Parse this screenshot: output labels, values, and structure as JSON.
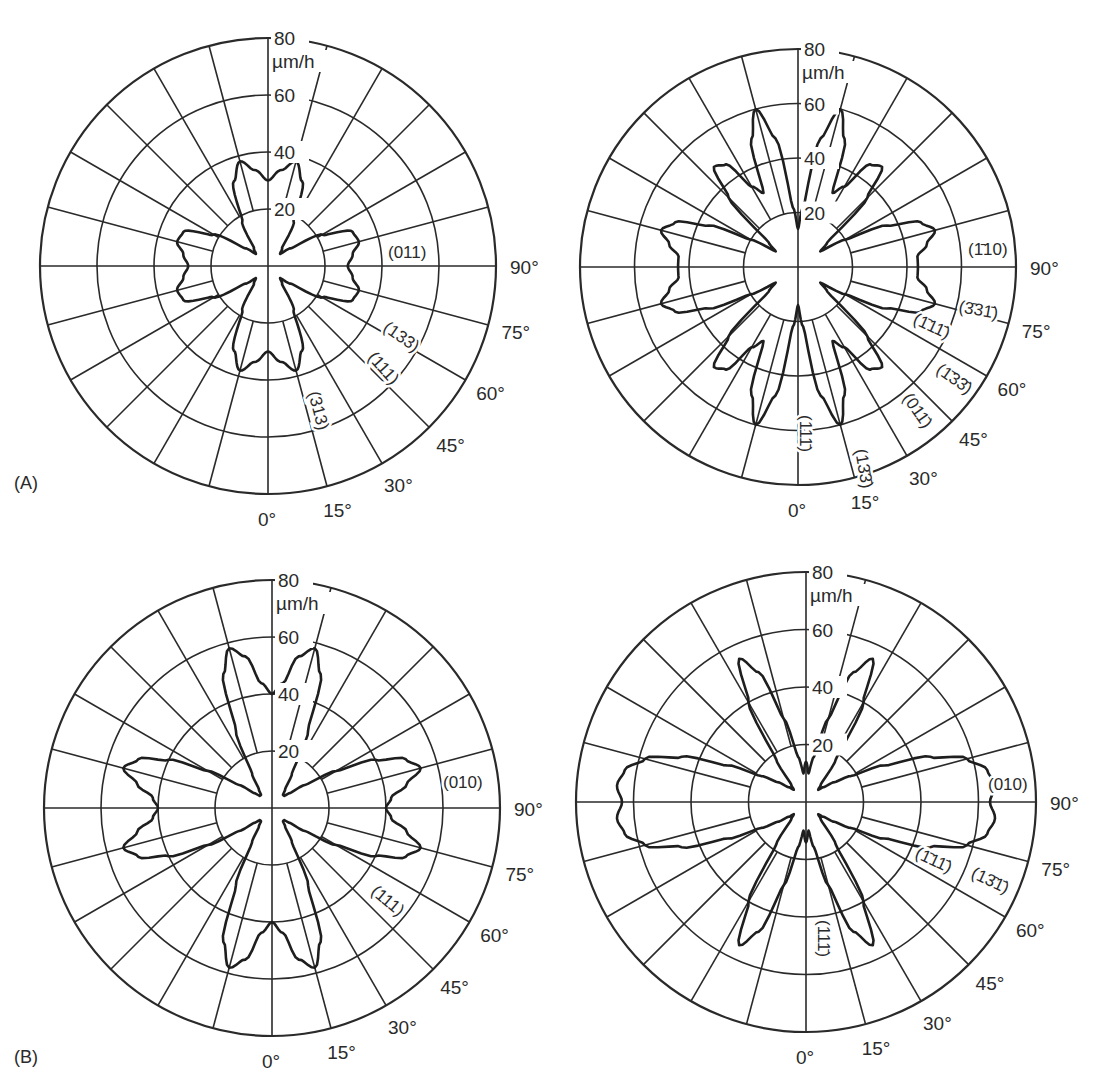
{
  "panel_labels": [
    "(A)",
    "(B)"
  ],
  "units": "µm/h",
  "radial_ticks": [
    "20",
    "40",
    "60",
    "80"
  ],
  "angle_ticks": [
    "0°",
    "15°",
    "30°",
    "45°",
    "60°",
    "75°",
    "90°"
  ],
  "colors": {
    "ink": "#2a2a2a",
    "background": "#ffffff"
  },
  "chart_data": [
    {
      "type": "polar-line",
      "panel": "A",
      "position": "top-left",
      "title": "",
      "rlabel": "µm/h",
      "rlim": [
        0,
        80
      ],
      "rticks": [
        20,
        40,
        60,
        80
      ],
      "angle_ticks_deg": [
        0,
        15,
        30,
        45,
        60,
        75,
        90
      ],
      "grid": true,
      "series": [
        {
          "name": "growth rate",
          "angles_deg": [
            0,
            8,
            15,
            22,
            30,
            38,
            45,
            52,
            60,
            68,
            75,
            82,
            90
          ],
          "values": [
            30,
            34,
            38,
            32,
            18,
            8,
            6,
            10,
            22,
            32,
            33,
            30,
            28
          ]
        }
      ],
      "annotations": [
        "(011)",
        "(133)",
        "(111)",
        "(313)"
      ]
    },
    {
      "type": "polar-line",
      "panel": "A",
      "position": "top-right",
      "title": "",
      "rlabel": "µm/h",
      "rlim": [
        0,
        80
      ],
      "rticks": [
        20,
        40,
        60,
        80
      ],
      "angle_ticks_deg": [
        0,
        15,
        30,
        45,
        60,
        75,
        90
      ],
      "grid": true,
      "series": [
        {
          "name": "growth rate",
          "angles_deg": [
            0,
            5,
            10,
            15,
            20,
            25,
            30,
            35,
            40,
            45,
            50,
            55,
            60,
            65,
            70,
            75,
            80,
            85,
            90
          ],
          "values": [
            14,
            22,
            48,
            60,
            50,
            30,
            34,
            46,
            48,
            36,
            14,
            10,
            20,
            36,
            48,
            52,
            48,
            44,
            44
          ]
        }
      ],
      "annotations": [
        "(1̄10)",
        "(3̄31̄)",
        "(1̄11̄)",
        "(1̄33̄)",
        "(011̄)",
        "(13̄3̄)",
        "(111̄)"
      ]
    },
    {
      "type": "polar-line",
      "panel": "B",
      "position": "bottom-left",
      "title": "",
      "rlabel": "µm/h",
      "rlim": [
        0,
        80
      ],
      "rticks": [
        20,
        40,
        60,
        80
      ],
      "angle_ticks_deg": [
        0,
        15,
        30,
        45,
        60,
        75,
        90
      ],
      "grid": true,
      "series": [
        {
          "name": "growth rate",
          "angles_deg": [
            0,
            5,
            10,
            15,
            20,
            25,
            30,
            35,
            40,
            45,
            50,
            55,
            60,
            65,
            70,
            75,
            80,
            85,
            90
          ],
          "values": [
            40,
            44,
            54,
            58,
            50,
            30,
            14,
            8,
            6,
            6,
            8,
            14,
            26,
            40,
            50,
            54,
            48,
            42,
            40
          ]
        }
      ],
      "annotations": [
        "(010)",
        "(111)"
      ]
    },
    {
      "type": "polar-line",
      "panel": "B",
      "position": "bottom-right",
      "title": "",
      "rlabel": "µm/h",
      "rlim": [
        0,
        80
      ],
      "rticks": [
        20,
        40,
        60,
        80
      ],
      "angle_ticks_deg": [
        0,
        15,
        30,
        45,
        60,
        75,
        90
      ],
      "grid": true,
      "series": [
        {
          "name": "growth rate",
          "angles_deg": [
            0,
            5,
            10,
            15,
            20,
            25,
            30,
            35,
            40,
            45,
            50,
            55,
            60,
            65,
            70,
            75,
            80,
            85,
            90
          ],
          "values": [
            14,
            10,
            16,
            30,
            48,
            55,
            40,
            18,
            8,
            6,
            8,
            12,
            18,
            30,
            46,
            58,
            64,
            66,
            64
          ]
        }
      ],
      "annotations": [
        "(010)",
        "(1̄11̄)",
        "(13̄1̄)",
        "(111̄)"
      ]
    }
  ],
  "layout": {
    "charts": [
      {
        "cx": 268,
        "cy": 266,
        "r": 228
      },
      {
        "cx": 798,
        "cy": 267,
        "r": 218
      },
      {
        "cx": 272,
        "cy": 808,
        "r": 228
      },
      {
        "cx": 806,
        "cy": 802,
        "r": 230
      }
    ]
  },
  "annotation_labels": [
    [
      {
        "text": "(011)",
        "x": 388,
        "y": 258,
        "rot": 0
      },
      {
        "text": "(133)",
        "x": 382,
        "y": 330,
        "rot": 35
      },
      {
        "text": "(111)",
        "x": 367,
        "y": 358,
        "rot": 48
      },
      {
        "text": "(313)",
        "x": 308,
        "y": 393,
        "rot": 75
      }
    ],
    [
      {
        "text": "(1̄10)",
        "x": 968,
        "y": 255,
        "rot": 0
      },
      {
        "text": "(3̄31̄)",
        "x": 958,
        "y": 312,
        "rot": 10
      },
      {
        "text": "(1̄11̄)",
        "x": 912,
        "y": 323,
        "rot": 25
      },
      {
        "text": "(1̄33̄)",
        "x": 935,
        "y": 372,
        "rot": 35
      },
      {
        "text": "(011̄)",
        "x": 902,
        "y": 398,
        "rot": 55
      },
      {
        "text": "(13̄3̄)",
        "x": 855,
        "y": 450,
        "rot": 80
      },
      {
        "text": "(111̄)",
        "x": 800,
        "y": 415,
        "rot": 90
      }
    ],
    [
      {
        "text": "(010)",
        "x": 443,
        "y": 788,
        "rot": 0
      },
      {
        "text": "(111)",
        "x": 370,
        "y": 893,
        "rot": 40
      }
    ],
    [
      {
        "text": "(010)",
        "x": 988,
        "y": 790,
        "rot": 0
      },
      {
        "text": "(1̄11̄)",
        "x": 914,
        "y": 857,
        "rot": 25
      },
      {
        "text": "(13̄1̄)",
        "x": 970,
        "y": 877,
        "rot": 25
      },
      {
        "text": "(111̄)",
        "x": 818,
        "y": 920,
        "rot": 90
      }
    ]
  ]
}
